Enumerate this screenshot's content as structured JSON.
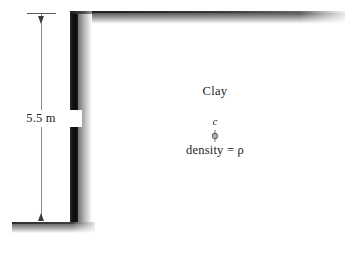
{
  "figure": {
    "background_color": "#ffffff"
  },
  "dimension": {
    "label": "5.5 m",
    "value": 5.5,
    "unit": "m",
    "measures": "wall height",
    "line_color": "#8a8a8a",
    "arrow_color": "#3c3c3c"
  },
  "soil": {
    "name": "Clay",
    "cohesion_symbol": "c",
    "friction_angle_symbol": "ϕ",
    "density_label": "density = ρ"
  },
  "structure": {
    "wall_name": "vertical-wall",
    "wall_color": "#111111",
    "ground_surface_name": "upper-ground-surface",
    "base_name": "base-ground-line",
    "shadow_color": "#9c9c9c"
  }
}
